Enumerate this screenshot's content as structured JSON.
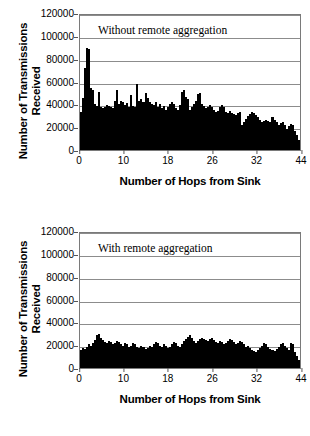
{
  "figure": {
    "background": "#ffffff",
    "series_color": "#000000",
    "grid_color": "#8c8c8c",
    "frame_color": "#7a7a7a"
  },
  "chart_data": [
    {
      "type": "bar",
      "title": "Without remote aggregation",
      "xlabel": "Number of Hops from Sink",
      "ylabel": "Number of Transmissions Received",
      "ylabel_line1": "Number of Transmissions",
      "ylabel_line2": "Received",
      "ylim": [
        0,
        120000
      ],
      "yticks": [
        0,
        20000,
        40000,
        60000,
        80000,
        100000,
        120000
      ],
      "ytick_labels": [
        "0",
        "20000",
        "40000",
        "60000",
        "80000",
        "100000",
        "120000"
      ],
      "xlim": [
        0,
        44
      ],
      "xticks": [
        0,
        10,
        18,
        26,
        32,
        44
      ],
      "xtick_labels": [
        "0",
        "10",
        "18",
        "26",
        "32",
        "44"
      ],
      "grid": true,
      "legend": "none",
      "categories": [
        0,
        1,
        2,
        3,
        4,
        5,
        6,
        7,
        8,
        9,
        10,
        11,
        12,
        13,
        14,
        15,
        16,
        17,
        18,
        19,
        20,
        21,
        22,
        23,
        24,
        25,
        26,
        27,
        28,
        29,
        30,
        31,
        32,
        33,
        34,
        35,
        36,
        37,
        38,
        39,
        40,
        41,
        42,
        43,
        44,
        45,
        46,
        47,
        48,
        49,
        50,
        51,
        52,
        53,
        54,
        55,
        56,
        57,
        58,
        59,
        60,
        61,
        62,
        63,
        64,
        65,
        66,
        67,
        68,
        69,
        70,
        71,
        72,
        73,
        74,
        75,
        76,
        77,
        78,
        79,
        80,
        81,
        82,
        83,
        84,
        85,
        86,
        87,
        88,
        89,
        90,
        91,
        92,
        93,
        94,
        95,
        96,
        97,
        98,
        99,
        100,
        101,
        102,
        103,
        104,
        105,
        106,
        107,
        108
      ],
      "values": [
        34000,
        46000,
        73000,
        91000,
        90000,
        55000,
        53000,
        41000,
        39000,
        52000,
        38000,
        37000,
        38000,
        40000,
        39000,
        38000,
        37000,
        44000,
        53000,
        41000,
        44000,
        43000,
        40000,
        42000,
        38000,
        49000,
        39000,
        38000,
        59000,
        44000,
        45000,
        43000,
        51000,
        46000,
        43000,
        41000,
        40000,
        43000,
        38000,
        41000,
        37000,
        39000,
        36000,
        38000,
        41000,
        43000,
        41000,
        37000,
        36000,
        40000,
        52000,
        53000,
        47000,
        45000,
        36000,
        38000,
        41000,
        44000,
        50000,
        51000,
        41000,
        39000,
        37000,
        38000,
        40000,
        38000,
        36000,
        34000,
        35000,
        38000,
        40000,
        38000,
        34000,
        33000,
        35000,
        33000,
        32000,
        31000,
        33000,
        34000,
        22000,
        25000,
        28000,
        30000,
        32000,
        34000,
        33000,
        31000,
        29000,
        27000,
        25000,
        26000,
        27000,
        26000,
        25000,
        29000,
        27000,
        25000,
        22000,
        24000,
        25000,
        22000,
        19000,
        21000,
        23000,
        22000,
        17000,
        13000,
        9000
      ]
    },
    {
      "type": "bar",
      "title": "With remote aggregation",
      "xlabel": "Number of Hops from Sink",
      "ylabel": "Number of Transmissions Received",
      "ylabel_line1": "Number of Transmissions",
      "ylabel_line2": "Received",
      "ylim": [
        0,
        120000
      ],
      "yticks": [
        0,
        20000,
        40000,
        60000,
        80000,
        100000,
        120000
      ],
      "ytick_labels": [
        "0",
        "20000",
        "40000",
        "60000",
        "80000",
        "100000",
        "120000"
      ],
      "xlim": [
        0,
        44
      ],
      "xticks": [
        0,
        10,
        18,
        26,
        32,
        44
      ],
      "xtick_labels": [
        "0",
        "10",
        "18",
        "26",
        "32",
        "44"
      ],
      "grid": true,
      "legend": "none",
      "categories": [
        0,
        1,
        2,
        3,
        4,
        5,
        6,
        7,
        8,
        9,
        10,
        11,
        12,
        13,
        14,
        15,
        16,
        17,
        18,
        19,
        20,
        21,
        22,
        23,
        24,
        25,
        26,
        27,
        28,
        29,
        30,
        31,
        32,
        33,
        34,
        35,
        36,
        37,
        38,
        39,
        40,
        41,
        42,
        43,
        44,
        45,
        46,
        47,
        48,
        49,
        50,
        51,
        52,
        53,
        54,
        55,
        56,
        57,
        58,
        59,
        60,
        61,
        62,
        63,
        64,
        65,
        66,
        67,
        68,
        69,
        70,
        71,
        72,
        73,
        74,
        75,
        76,
        77,
        78,
        79,
        80,
        81,
        82,
        83,
        84,
        85,
        86,
        87,
        88,
        89,
        90,
        91,
        92,
        93,
        94,
        95,
        96,
        97,
        98,
        99,
        100,
        101,
        102,
        103,
        104,
        105,
        106,
        107,
        108
      ],
      "values": [
        16000,
        18000,
        17000,
        19000,
        21000,
        20000,
        22000,
        25000,
        29000,
        30000,
        27000,
        25000,
        23000,
        22000,
        24000,
        23000,
        21000,
        22000,
        24000,
        23000,
        21000,
        20000,
        22000,
        21000,
        19000,
        20000,
        22000,
        21000,
        19000,
        18000,
        20000,
        19000,
        17000,
        18000,
        20000,
        19000,
        21000,
        23000,
        22000,
        20000,
        19000,
        21000,
        20000,
        18000,
        19000,
        21000,
        23000,
        22000,
        20000,
        19000,
        21000,
        24000,
        26000,
        28000,
        29000,
        27000,
        24000,
        22000,
        24000,
        26000,
        27000,
        26000,
        25000,
        24000,
        26000,
        27000,
        25000,
        23000,
        22000,
        24000,
        23000,
        21000,
        22000,
        24000,
        26000,
        25000,
        23000,
        21000,
        22000,
        24000,
        23000,
        21000,
        19000,
        20000,
        18000,
        16000,
        15000,
        14000,
        16000,
        18000,
        20000,
        22000,
        21000,
        19000,
        17000,
        16000,
        15000,
        17000,
        19000,
        21000,
        22000,
        20000,
        18000,
        16000,
        22000,
        21000,
        14000,
        11000,
        7000
      ]
    }
  ]
}
